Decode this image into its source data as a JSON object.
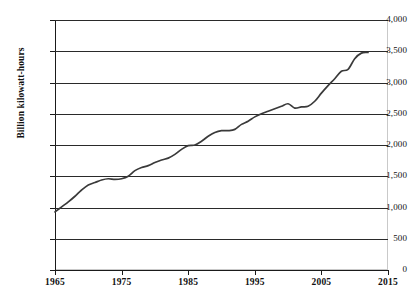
{
  "chart_data": {
    "type": "line",
    "title": "",
    "subtitle": "",
    "xlabel": "",
    "ylabel": "Billion kilowatt-hours",
    "xlim": [
      1965,
      2015
    ],
    "ylim": [
      0,
      4000
    ],
    "grid": true,
    "legend": null,
    "y_ticks": [
      "4,000",
      "3,500",
      "3,000",
      "2,500",
      "2,000",
      "1,500",
      "1,000",
      "500",
      "0"
    ],
    "y_tick_values": [
      4000,
      3500,
      3000,
      2500,
      2000,
      1500,
      1000,
      500,
      0
    ],
    "x_ticks": [
      "1965",
      "1975",
      "1985",
      "1995",
      "2005",
      "2015"
    ],
    "x_tick_values": [
      1965,
      1975,
      1985,
      1995,
      2005,
      2015
    ],
    "series": [
      {
        "name": "Net electricity generation",
        "color": "#3a3a3a",
        "x": [
          1965,
          1966,
          1967,
          1968,
          1969,
          1970,
          1971,
          1972,
          1973,
          1974,
          1975,
          1976,
          1977,
          1978,
          1979,
          1980,
          1981,
          1982,
          1983,
          1984,
          1985,
          1986,
          1987,
          1988,
          1989,
          1990,
          1991,
          1992,
          1993,
          1994,
          1995,
          1996,
          1997,
          1998,
          1999,
          2000,
          2001,
          2002,
          2003,
          2004,
          2005,
          2006,
          2007,
          2008,
          2009,
          2010,
          2011,
          2012
        ],
        "values": [
          930,
          1010,
          1090,
          1180,
          1280,
          1360,
          1400,
          1440,
          1460,
          1450,
          1460,
          1500,
          1590,
          1640,
          1670,
          1720,
          1760,
          1790,
          1850,
          1930,
          1990,
          2000,
          2060,
          2140,
          2200,
          2230,
          2230,
          2250,
          2330,
          2380,
          2450,
          2500,
          2540,
          2580,
          2620,
          2660,
          2590,
          2610,
          2620,
          2700,
          2830,
          2950,
          3060,
          3180,
          3210,
          3380,
          3470,
          3480
        ]
      }
    ]
  },
  "axes": {
    "y_title": "Billion kilowatt-hours"
  },
  "colors": {
    "line": "#3a3a3a",
    "grid": "#2a2a2a",
    "frame": "#c9c9c9",
    "text": "#111111",
    "background": "#ffffff"
  }
}
